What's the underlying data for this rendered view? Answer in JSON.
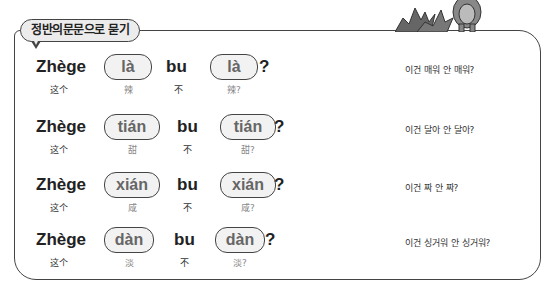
{
  "header": {
    "title": "정반의문문으로 묻기"
  },
  "rows": [
    {
      "subject": "Zhège",
      "subject_hanzi": "这个",
      "word": "là",
      "word_hanzi": "辣",
      "neg": "bu",
      "neg_hanzi": "不",
      "word2": "là",
      "word2_hanzi": "辣?",
      "qmark": "?",
      "korean": "이건 매워 안 매워?"
    },
    {
      "subject": "Zhège",
      "subject_hanzi": "这个",
      "word": "tián",
      "word_hanzi": "甜",
      "neg": "bu",
      "neg_hanzi": "不",
      "word2": "tián",
      "word2_hanzi": "甜?",
      "qmark": "?",
      "korean": "이건 달아 안 달아?"
    },
    {
      "subject": "Zhège",
      "subject_hanzi": "这个",
      "word": "xián",
      "word_hanzi": "咸",
      "neg": "bu",
      "neg_hanzi": "不",
      "word2": "xián",
      "word2_hanzi": "咸?",
      "qmark": "?",
      "korean": "이건 짜 안 짜?"
    },
    {
      "subject": "Zhège",
      "subject_hanzi": "这个",
      "word": "dàn",
      "word_hanzi": "淡",
      "neg": "bu",
      "neg_hanzi": "不",
      "word2": "dàn",
      "word2_hanzi": "淡?",
      "qmark": "?",
      "korean": "이건 싱거워 안 싱거워?"
    }
  ],
  "colors": {
    "border": "#444444",
    "pill_fill": "#f2f2f2",
    "pinyin_gray": "#666666"
  }
}
